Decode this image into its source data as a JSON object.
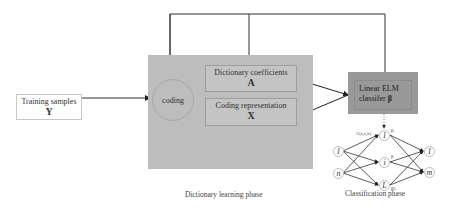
{
  "diagram": {
    "training": {
      "label": "Training samples",
      "symbol": "Y"
    },
    "coding": {
      "label": "coding"
    },
    "dictionary_coefficients": {
      "label": "Dictionary coefficients",
      "symbol": "A"
    },
    "coding_representation": {
      "label": "Coding representation",
      "symbol": "X"
    },
    "elm": {
      "line1": "Linear ELM",
      "line2": "classifer",
      "symbol": "β"
    },
    "network": {
      "input_nodes": [
        "1",
        "n"
      ],
      "hidden_nodes": [
        "1",
        "i",
        "L"
      ],
      "output_nodes": [
        "1",
        "m"
      ],
      "activation_label": "G(a,x,b)",
      "beta_labels": [
        "β₁",
        "βᵢ",
        "βL"
      ]
    },
    "captions": {
      "dictionary_phase": "Dictionary learning phase",
      "classification_phase": "Classification phase"
    },
    "colors": {
      "dict_panel": "#bdbdbd",
      "elm_panel": "#999999",
      "line": "#333333"
    }
  }
}
